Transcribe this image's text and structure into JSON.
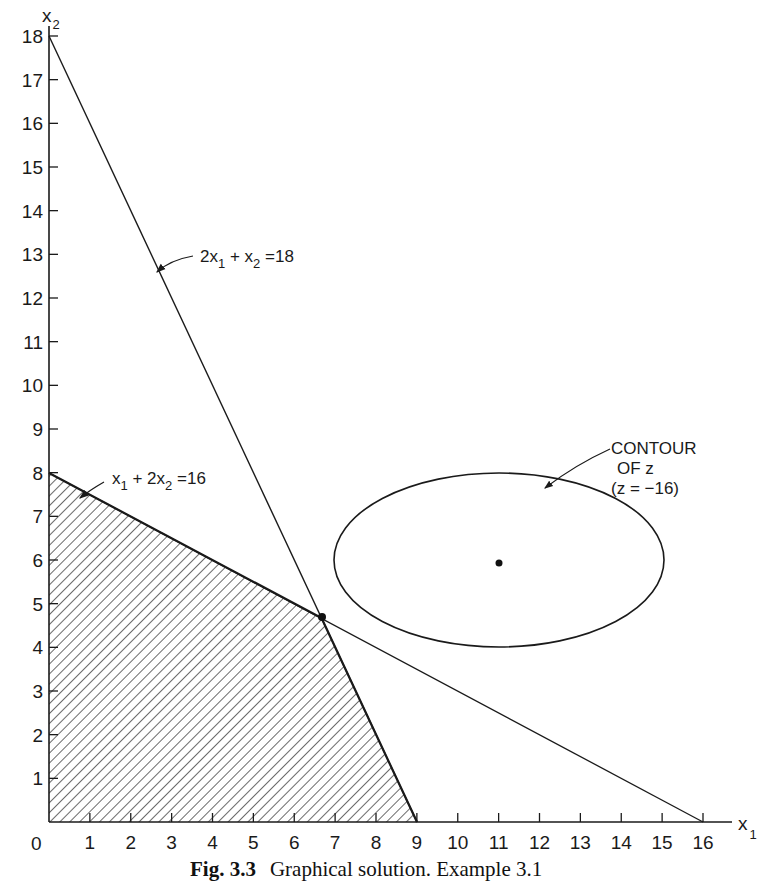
{
  "chart_data": {
    "type": "line",
    "title": "",
    "caption": {
      "label": "Fig. 3.3",
      "text": "Graphical solution. Example 3.1"
    },
    "xlabel": "x1",
    "ylabel": "x2",
    "xlim": [
      0,
      16.5
    ],
    "ylim": [
      0,
      18
    ],
    "grid": false,
    "x_ticks": [
      0,
      1,
      2,
      3,
      4,
      5,
      6,
      7,
      8,
      9,
      10,
      11,
      12,
      13,
      14,
      15,
      16
    ],
    "y_ticks": [
      1,
      2,
      3,
      4,
      5,
      6,
      7,
      8,
      9,
      10,
      11,
      12,
      13,
      14,
      15,
      16,
      17,
      18
    ],
    "series": [
      {
        "name": "2x1 + x2 = 18",
        "kind": "constraint-line",
        "points": [
          [
            0,
            18
          ],
          [
            9,
            0
          ]
        ]
      },
      {
        "name": "x1 + 2x2 = 16",
        "kind": "constraint-line",
        "points": [
          [
            0,
            8
          ],
          [
            16,
            0
          ]
        ]
      },
      {
        "name": "feasible region",
        "kind": "hatched-polygon",
        "points": [
          [
            0,
            0
          ],
          [
            0,
            8
          ],
          [
            6.667,
            4.667
          ],
          [
            9,
            0
          ]
        ]
      },
      {
        "name": "Contour of z (z = -16)",
        "kind": "ellipse",
        "center": [
          11,
          6
        ],
        "semi_axes": [
          4.05,
          2.0
        ]
      },
      {
        "name": "unconstrained optimum",
        "kind": "point",
        "points": [
          [
            11,
            6
          ]
        ]
      },
      {
        "name": "optimal solution",
        "kind": "point",
        "points": [
          [
            6.667,
            4.667
          ]
        ]
      }
    ],
    "annotations": [
      {
        "text": "2x1 + x2 = 18",
        "target": "line 2x1 + x2 = 18"
      },
      {
        "text": "x1 + 2x2 = 16",
        "target": "line x1 + 2x2 = 16"
      },
      {
        "text": "CONTOUR OF z (z = -16)",
        "target": "ellipse"
      }
    ]
  },
  "labels": {
    "x_axis": {
      "base": "x",
      "sub": "1"
    },
    "y_axis": {
      "base": "x",
      "sub": "2"
    },
    "origin": "0",
    "line1": {
      "a": "2x",
      "a_sub": "1",
      "b": " + x",
      "b_sub": "2",
      "rhs": " =18"
    },
    "line2": {
      "a": "x",
      "a_sub": "1",
      "b": " + 2x",
      "b_sub": "2",
      "rhs": " =16"
    },
    "contour": {
      "line1": "CONTOUR",
      "line2": "OF  z",
      "line3": "(z = −16)"
    },
    "caption_label": "Fig. 3.3",
    "caption_text": "Graphical solution. Example 3.1"
  },
  "colors": {
    "ink": "#1a1a1a",
    "background": "#ffffff"
  }
}
